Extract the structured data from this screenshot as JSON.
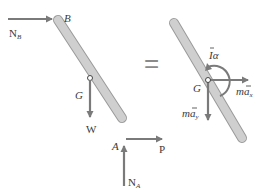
{
  "diagram": {
    "equals_sign": "=",
    "left": {
      "labels": {
        "B": "B",
        "G": "G",
        "A": "A",
        "W": "W",
        "P": "P",
        "NB": "N",
        "NB_sub": "B",
        "NA": "N",
        "NA_sub": "A"
      }
    },
    "right": {
      "labels": {
        "G": "G",
        "Ialpha": "Iα",
        "max": "ma",
        "max_sub": "x",
        "may": "ma",
        "may_sub": "y"
      }
    },
    "colors": {
      "rod_fill": "#c8c8c8",
      "rod_stroke": "#9a9a9a",
      "arrow": "#7a7a7a",
      "text": "#3a3a3a"
    }
  }
}
